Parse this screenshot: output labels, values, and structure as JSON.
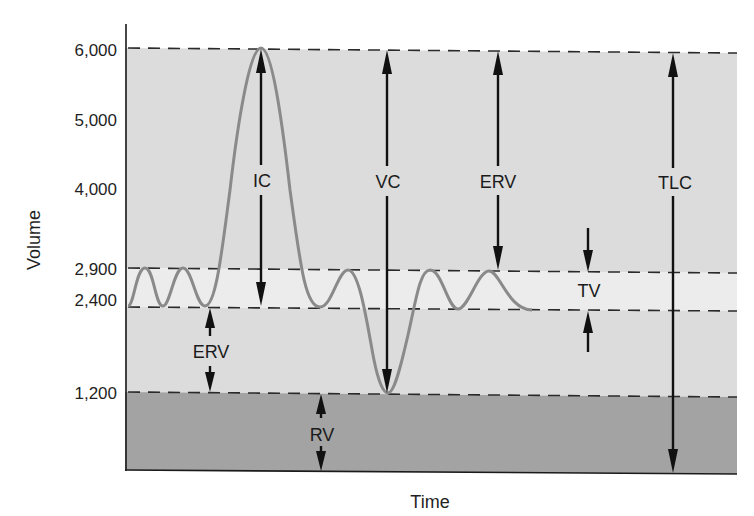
{
  "diagram": {
    "y_axis_title": "Volume",
    "x_axis_title": "Time",
    "y_ticks": [
      {
        "label": "6,000",
        "value": 6000
      },
      {
        "label": "5,000",
        "value": 5000
      },
      {
        "label": "4,000",
        "value": 4000
      },
      {
        "label": "2,900",
        "value": 2900
      },
      {
        "label": "2,400",
        "value": 2400
      },
      {
        "label": "1,200",
        "value": 1200
      }
    ],
    "reference_levels": [
      6000,
      2900,
      2400,
      1200
    ],
    "measurements": [
      {
        "label": "IC",
        "name": "inspiratory-capacity",
        "from": 2400,
        "to": 6000
      },
      {
        "label": "VC",
        "name": "vital-capacity",
        "from": 1200,
        "to": 6000
      },
      {
        "label": "ERV",
        "name": "expiratory-reserve-volume-upper",
        "from": 2900,
        "to": 6000
      },
      {
        "label": "TLC",
        "name": "total-lung-capacity",
        "from": 0,
        "to": 6000
      },
      {
        "label": "ERV",
        "name": "expiratory-reserve-volume-lower",
        "from": 1200,
        "to": 2400
      },
      {
        "label": "RV",
        "name": "residual-volume",
        "from": 0,
        "to": 1200
      },
      {
        "label": "TV",
        "name": "tidal-volume",
        "from": 2400,
        "to": 2900
      }
    ],
    "colors": {
      "band_upper": "#dcdcdc",
      "band_tidal": "#ececec",
      "band_lower": "#dcdcdc",
      "band_residual": "#a3a3a3",
      "trace": "#8a8a8a",
      "arrows": "#111111"
    }
  }
}
